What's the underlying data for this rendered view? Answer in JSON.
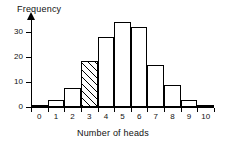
{
  "chart_data": {
    "type": "bar",
    "title": "",
    "xlabel": "Number of heads",
    "ylabel": "Frequency",
    "categories": [
      "0",
      "1",
      "2",
      "3",
      "4",
      "5",
      "6",
      "7",
      "8",
      "9",
      "10"
    ],
    "values": [
      1,
      3,
      7.5,
      18.5,
      28,
      34,
      32,
      17,
      9,
      3,
      1
    ],
    "highlighted_category": "3",
    "highlight_style": "diagonal-hatch",
    "yticks": [
      0,
      10,
      20,
      30
    ],
    "ylim": [
      0,
      36
    ],
    "xtick_labels": [
      "0",
      "1",
      "2",
      "3",
      "4",
      "5",
      "6",
      "7",
      "8",
      "9",
      "10"
    ],
    "grid": false,
    "legend": false,
    "bar_fill": "#ffffff",
    "bar_edge": "#000000"
  },
  "axes": {
    "y_label": "Frequency",
    "x_label": "Number of heads",
    "y_tick_labels": [
      "0",
      "10",
      "20",
      "30"
    ]
  }
}
